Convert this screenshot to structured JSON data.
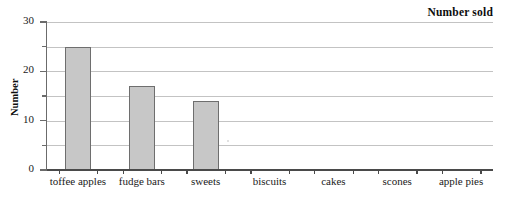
{
  "chart_data": {
    "type": "bar",
    "title": "Number sold",
    "xlabel": "",
    "ylabel": "Number",
    "categories": [
      "toffee apples",
      "fudge bars",
      "sweets",
      "biscuits",
      "cakes",
      "scones",
      "apple pies"
    ],
    "values": [
      25,
      17,
      14,
      0,
      0,
      0,
      0
    ],
    "ylim": [
      0,
      30
    ],
    "y_major_ticks": [
      0,
      10,
      20,
      30
    ],
    "y_major_labels": [
      "0",
      "10",
      "20",
      "30"
    ],
    "y_minor_ticks": [
      5,
      15,
      25
    ],
    "gridlines": true,
    "grid_values": [
      5,
      10,
      15,
      20,
      25,
      30
    ],
    "legend": false,
    "bar_fill_color": "#c7c7c7",
    "bar_border_color": "#6e6e6e",
    "gridline_color": "#c3c3c3",
    "axis_color": "#4a4a4a",
    "text_color": "#1a1a1a"
  }
}
